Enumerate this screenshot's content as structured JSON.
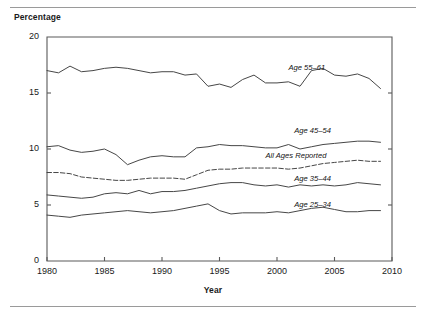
{
  "figure": {
    "y_axis_title": "Percentage",
    "x_axis_title": "Year",
    "has_top_rule": true,
    "has_bottom_rule": true,
    "line_color": "#3c3c3c",
    "axis_color": "#5a5a5a"
  },
  "chart_data": {
    "type": "line",
    "title": "",
    "subtitle": "",
    "xlabel": "Year",
    "ylabel": "Percentage",
    "xlim": [
      1980,
      2010
    ],
    "ylim": [
      0,
      20
    ],
    "yticks": [
      0,
      5,
      10,
      15,
      20
    ],
    "xticks": [
      1980,
      1985,
      1990,
      1995,
      2000,
      2005,
      2010
    ],
    "grid": false,
    "legend_position": "inline-right-of-series",
    "x": [
      1980,
      1981,
      1982,
      1983,
      1984,
      1985,
      1986,
      1987,
      1988,
      1989,
      1990,
      1991,
      1992,
      1993,
      1994,
      1995,
      1996,
      1997,
      1998,
      1999,
      2000,
      2001,
      2002,
      2003,
      2004,
      2005,
      2006,
      2007,
      2008,
      2009
    ],
    "series": [
      {
        "name": "Age 55–61",
        "style": "solid",
        "label_x": 2001.0,
        "label_y": 17.2,
        "values": [
          17.0,
          16.8,
          17.4,
          16.9,
          17.0,
          17.2,
          17.3,
          17.2,
          17.0,
          16.8,
          16.9,
          16.9,
          16.6,
          16.7,
          15.6,
          15.8,
          15.5,
          16.2,
          16.6,
          15.9,
          15.9,
          16.0,
          15.6,
          17.0,
          17.2,
          16.6,
          16.5,
          16.7,
          16.3,
          15.4
        ]
      },
      {
        "name": "Age 45–54",
        "style": "solid",
        "label_x": 2001.5,
        "label_y": 11.6,
        "values": [
          10.2,
          10.3,
          9.9,
          9.7,
          9.8,
          10.0,
          9.5,
          8.6,
          9.0,
          9.3,
          9.4,
          9.3,
          9.3,
          10.1,
          10.2,
          10.4,
          10.3,
          10.3,
          10.2,
          10.1,
          10.1,
          10.4,
          10.0,
          10.2,
          10.4,
          10.5,
          10.6,
          10.7,
          10.7,
          10.6
        ]
      },
      {
        "name": "All Ages Reported",
        "style": "dashed",
        "label_x": 1999.0,
        "label_y": 9.4,
        "values": [
          7.9,
          7.9,
          7.8,
          7.5,
          7.4,
          7.3,
          7.2,
          7.2,
          7.3,
          7.4,
          7.4,
          7.4,
          7.3,
          7.7,
          8.1,
          8.2,
          8.2,
          8.3,
          8.3,
          8.3,
          8.3,
          8.2,
          8.3,
          8.5,
          8.7,
          8.8,
          8.9,
          9.0,
          8.9,
          8.9
        ]
      },
      {
        "name": "Age 35–44",
        "style": "solid",
        "label_x": 2001.5,
        "label_y": 7.3,
        "values": [
          5.9,
          5.8,
          5.7,
          5.6,
          5.7,
          6.0,
          6.1,
          6.0,
          6.3,
          6.0,
          6.2,
          6.2,
          6.3,
          6.5,
          6.7,
          6.9,
          7.0,
          7.0,
          6.8,
          6.7,
          6.8,
          6.6,
          6.8,
          6.7,
          6.8,
          6.7,
          6.8,
          7.0,
          6.9,
          6.8
        ]
      },
      {
        "name": "Age 25–34",
        "style": "solid",
        "label_x": 2001.5,
        "label_y": 5.0,
        "values": [
          4.1,
          4.0,
          3.9,
          4.1,
          4.2,
          4.3,
          4.4,
          4.5,
          4.4,
          4.3,
          4.4,
          4.5,
          4.7,
          4.9,
          5.1,
          4.5,
          4.2,
          4.3,
          4.3,
          4.3,
          4.4,
          4.3,
          4.5,
          4.7,
          4.8,
          4.6,
          4.4,
          4.4,
          4.5,
          4.5
        ]
      }
    ]
  }
}
